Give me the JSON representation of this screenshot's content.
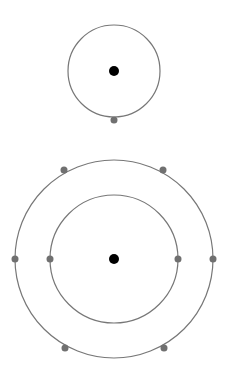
{
  "diagram": {
    "title": "",
    "colors": {
      "orbit": "#777777",
      "nucleus": "#000000",
      "electron": "#707070",
      "background": "#ffffff"
    },
    "atoms": [
      {
        "name": "atom-1",
        "nucleus": {
          "cx": 114,
          "cy": 71,
          "r": 5
        },
        "shells": [
          {
            "r": 46,
            "electrons": [
              {
                "cx": 114,
                "cy": 120
              }
            ]
          }
        ]
      },
      {
        "name": "atom-2",
        "nucleus": {
          "cx": 114,
          "cy": 259,
          "r": 5
        },
        "shells": [
          {
            "r": 64,
            "electrons": [
              {
                "cx": 50,
                "cy": 259
              },
              {
                "cx": 178,
                "cy": 259
              }
            ]
          },
          {
            "r": 99,
            "electrons": [
              {
                "cx": 15,
                "cy": 259
              },
              {
                "cx": 213,
                "cy": 259
              },
              {
                "cx": 64,
                "cy": 170
              },
              {
                "cx": 163,
                "cy": 170
              },
              {
                "cx": 65,
                "cy": 348
              },
              {
                "cx": 164,
                "cy": 348
              }
            ]
          }
        ]
      }
    ]
  }
}
